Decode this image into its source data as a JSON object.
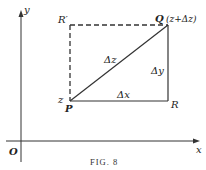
{
  "figure": {
    "caption": "Fig. 8",
    "caption_display": "FIG. 8",
    "axes": {
      "x_label": "x",
      "y_label": "y",
      "origin_label": "O"
    },
    "points": {
      "P": {
        "label": "P",
        "annotation": "z"
      },
      "Q": {
        "label": "Q",
        "annotation": "(z+Δz)"
      },
      "R": {
        "label": "R"
      },
      "R_prime": {
        "label": "R′"
      }
    },
    "segments": {
      "PQ": {
        "label": "Δz",
        "style": "solid"
      },
      "PR": {
        "label": "Δx",
        "style": "solid"
      },
      "RQ": {
        "label": "Δy",
        "style": "solid"
      },
      "RpQ": {
        "label": "",
        "style": "dashed"
      },
      "RpP": {
        "label": "",
        "style": "dashed"
      }
    },
    "colors": {
      "ink": "#222222",
      "background": "#ffffff"
    }
  }
}
